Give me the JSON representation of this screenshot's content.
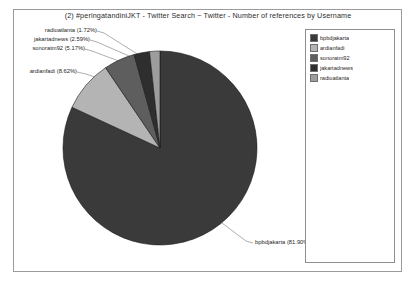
{
  "chart_data": {
    "type": "pie",
    "title": "(2) #peringatandiniJKT - Twitter Search ~ Twitter - Number of references by Username",
    "xlabel": "",
    "ylabel": "",
    "legend_position": "right",
    "grid": false,
    "categories": [
      "bpbdjakarta",
      "ardianfadi",
      "sonoratm92",
      "jakartadnews",
      "radioatlanta"
    ],
    "values": [
      81.9,
      8.62,
      5.17,
      2.59,
      1.72
    ],
    "value_unit": "percent",
    "colors": [
      "#3a3a3a",
      "#b4b4b4",
      "#5e5e5e",
      "#2e2e2e",
      "#9d9d9d"
    ],
    "labels": [
      "bpbdjakarta (81.90%)",
      "ardianfadi (8.62%)",
      "sonoratm92 (5.17%)",
      "jakartadnews (2.59%)",
      "radioatlanta (1.72%)"
    ]
  },
  "legend": {
    "items": [
      {
        "label": "bpbdjakarta",
        "color": "#3a3a3a"
      },
      {
        "label": "ardianfadi",
        "color": "#b4b4b4"
      },
      {
        "label": "sonoratm92",
        "color": "#5e5e5e"
      },
      {
        "label": "jakartadnews",
        "color": "#2e2e2e"
      },
      {
        "label": "radioatlanta",
        "color": "#9d9d9d"
      }
    ]
  },
  "slice_labels": {
    "radioatlanta": "radioatlanta (1.72%)",
    "jakartadnews": "jakartadnews (2.59%)",
    "sonoratm92": "sonoratm92 (5.17%)",
    "ardianfadi": "ardianfadi (8.62%)",
    "bpbdjakarta": "bpbdjakarta (81.90%)"
  }
}
